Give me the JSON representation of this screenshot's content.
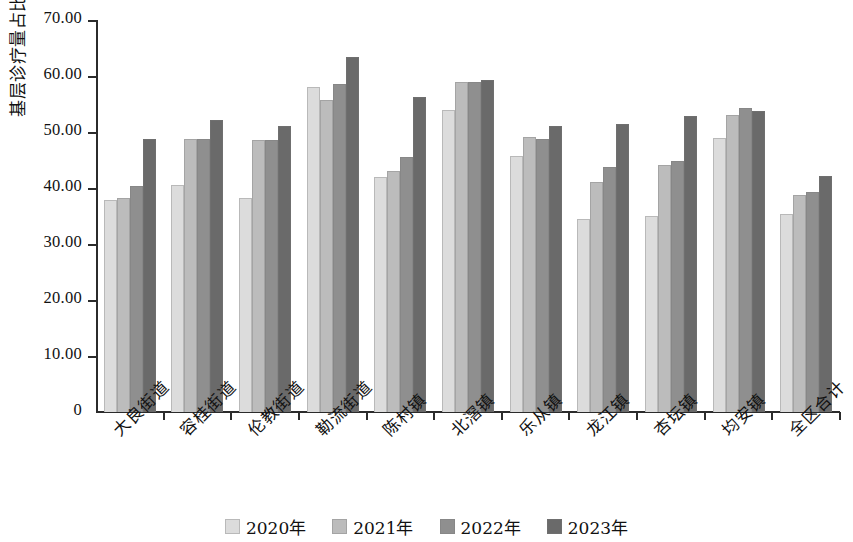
{
  "chart_data": {
    "type": "bar",
    "title": "",
    "xlabel": "",
    "ylabel": "基层诊疗量占比/%",
    "ylim": [
      0,
      70
    ],
    "ytick_labels": [
      "70.00",
      "60.00",
      "50.00",
      "40.00",
      "30.00",
      "20.00",
      "10.00",
      "0"
    ],
    "ytick_values": [
      70,
      60,
      50,
      40,
      30,
      20,
      10,
      0
    ],
    "grid": false,
    "legend_position": "bottom",
    "categories": [
      "大良街道",
      "容桂街道",
      "伦教街道",
      "勒流街道",
      "陈村镇",
      "北滘镇",
      "乐从镇",
      "龙江镇",
      "杏坛镇",
      "均安镇",
      "全区合计"
    ],
    "series": [
      {
        "name": "2020年",
        "color": "#dcdcdc",
        "values": [
          37.8,
          40.5,
          38.3,
          58.1,
          41.9,
          53.9,
          45.8,
          34.5,
          35.0,
          49.0,
          35.3
        ]
      },
      {
        "name": "2021年",
        "color": "#bcbcbc",
        "values": [
          38.2,
          48.7,
          48.5,
          55.8,
          43.0,
          58.9,
          49.1,
          41.0,
          44.1,
          53.0,
          38.8
        ]
      },
      {
        "name": "2022年",
        "color": "#8f8f8f",
        "values": [
          40.3,
          48.8,
          48.6,
          58.6,
          45.6,
          58.9,
          48.8,
          43.7,
          44.9,
          54.2,
          39.3
        ]
      },
      {
        "name": "2023年",
        "color": "#6a6a6a",
        "values": [
          48.8,
          52.2,
          51.0,
          63.4,
          56.2,
          59.3,
          51.0,
          51.4,
          52.8,
          53.8,
          42.2
        ]
      }
    ]
  }
}
